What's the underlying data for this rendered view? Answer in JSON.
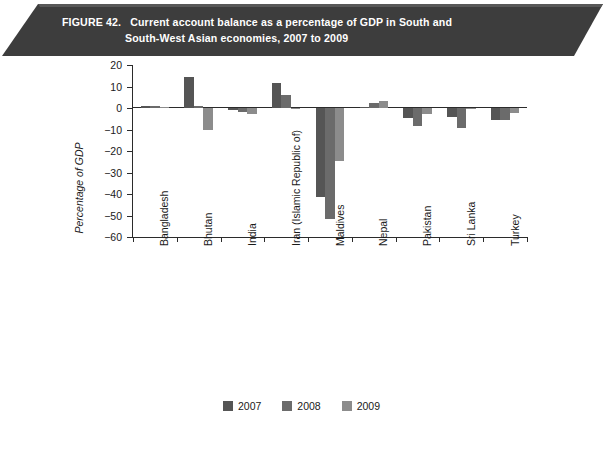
{
  "figure": {
    "label": "FIGURE 42.",
    "title_line1": "Current account balance as a percentage of GDP in South and",
    "title_line2": "South-West Asian economies, 2007 to 2009",
    "banner_color": "#3d3d3d",
    "banner_text_color": "#ffffff"
  },
  "chart_data": {
    "type": "bar",
    "title": "Current account balance as a percentage of GDP in South and South-West Asian economies, 2007 to 2009",
    "xlabel": "",
    "ylabel": "Percentage of GDP",
    "ylim": [
      -60,
      20
    ],
    "yticks": [
      20,
      10,
      0,
      -10,
      -20,
      -30,
      -40,
      -50,
      -60
    ],
    "ytick_labels": [
      "20",
      "10",
      "0",
      "−10",
      "−20",
      "−30",
      "−40",
      "−50",
      "−60"
    ],
    "grid": false,
    "legend_position": "bottom",
    "categories": [
      "Bangladesh",
      "Bhutan",
      "India",
      "Iran (Islamic Republic of)",
      "Maldives",
      "Nepal",
      "Pakistan",
      "Sri Lanka",
      "Turkey"
    ],
    "series": [
      {
        "name": "2007",
        "color": "#555555",
        "values": [
          1.0,
          14.2,
          -1.0,
          11.5,
          -41.5,
          0.4,
          -4.8,
          -4.3,
          -5.8
        ]
      },
      {
        "name": "2008",
        "color": "#6b6b6b",
        "values": [
          0.9,
          1.1,
          -2.0,
          6.0,
          -51.7,
          2.2,
          -8.4,
          -9.5,
          -5.6
        ]
      },
      {
        "name": "2009",
        "color": "#8c8c8c",
        "values": [
          0.3,
          -10.0,
          -2.9,
          -0.4,
          -24.8,
          3.3,
          -2.7,
          -0.6,
          -2.3
        ]
      }
    ]
  },
  "legend": {
    "items": [
      {
        "label": "2007",
        "color": "#555555"
      },
      {
        "label": "2008",
        "color": "#6b6b6b"
      },
      {
        "label": "2009",
        "color": "#8c8c8c"
      }
    ]
  }
}
